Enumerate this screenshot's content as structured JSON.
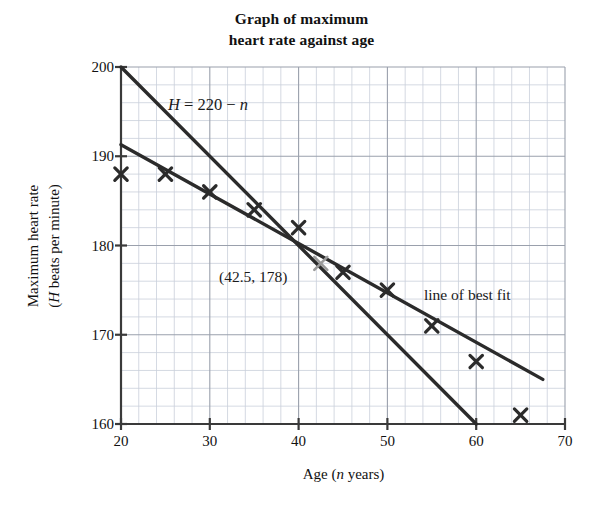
{
  "chart_data": {
    "type": "scatter",
    "title": "Graph of maximum heart rate against age",
    "title_lines": [
      "Graph of maximum",
      "heart rate against age"
    ],
    "xlabel": "Age (n years)",
    "xlabel_parts": {
      "pre": "Age (",
      "var": "n",
      "post": " years)"
    },
    "ylabel": "Maximum heart rate (H beats per minute)",
    "ylabel_lines": [
      "Maximum heart rate",
      "(H beats per minute)"
    ],
    "ylabel_line2": {
      "pre": "(",
      "var": "H",
      "post": " beats per minute)"
    },
    "xlim": [
      20,
      70
    ],
    "ylim": [
      160,
      200
    ],
    "xticks": [
      20,
      30,
      40,
      50,
      60,
      70
    ],
    "yticks": [
      160,
      170,
      180,
      190,
      200
    ],
    "x_major_step": 10,
    "y_major_step": 10,
    "x_minor_step": 2,
    "y_minor_step": 2,
    "grid": true,
    "legend": "none",
    "series": [
      {
        "name": "data points",
        "type": "scatter",
        "marker": "x",
        "color": "#2b2b2b",
        "points": [
          {
            "x": 20,
            "y": 188
          },
          {
            "x": 25,
            "y": 188
          },
          {
            "x": 30,
            "y": 186
          },
          {
            "x": 35,
            "y": 184
          },
          {
            "x": 40,
            "y": 182
          },
          {
            "x": 45,
            "y": 177
          },
          {
            "x": 50,
            "y": 175
          },
          {
            "x": 55,
            "y": 171
          },
          {
            "x": 60,
            "y": 167
          },
          {
            "x": 65,
            "y": 161
          }
        ]
      },
      {
        "name": "H = 220 - n",
        "type": "line",
        "color": "#2b2b2b",
        "from": {
          "x": 20,
          "y": 200
        },
        "to": {
          "x": 60,
          "y": 160
        },
        "slope": -1,
        "intercept": 220
      },
      {
        "name": "line of best fit",
        "type": "line",
        "color": "#2b2b2b",
        "from": {
          "x": 20,
          "y": 191.3
        },
        "to": {
          "x": 67.5,
          "y": 165
        }
      }
    ],
    "annotations": [
      {
        "name": "equation-label",
        "text": "H = 220 − n",
        "x": 37,
        "y": 196.2
      },
      {
        "name": "intersection-label",
        "text": "(42.5, 178)",
        "x": 31.5,
        "y": 177.2
      },
      {
        "name": "best-fit-label",
        "text": "line of best fit",
        "x": 54,
        "y": 175.0
      }
    ],
    "marked_point": {
      "x": 42.5,
      "y": 178,
      "label": "(42.5, 178)",
      "marker": "x",
      "color": "#9a9a9a"
    }
  },
  "annotations": {
    "equation": "H = 220 − n",
    "equation_parts": {
      "lhs": "H",
      "eq": " = 220 − ",
      "rhs": "n"
    },
    "point_label": "(42.5, 178)",
    "best_fit_label": "line of best fit"
  },
  "colors": {
    "ink": "#2b2b2b",
    "axis": "#3a3a3a",
    "major_grid": "#9aa0ac",
    "minor_grid": "#c9cfdb",
    "marked_point": "#9a9a9a",
    "background": "#ffffff"
  }
}
